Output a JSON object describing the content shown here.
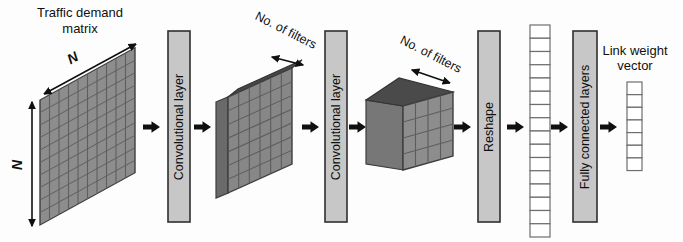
{
  "labels": {
    "traffic_matrix_lines": [
      "Traffic demand",
      "matrix"
    ],
    "matrix_dim_top": "N",
    "matrix_dim_left": "N",
    "conv1_filters": "No. of filters",
    "conv2_filters": "No. of filters",
    "output_lines": [
      "Link weight",
      "vector"
    ]
  },
  "layers": {
    "conv1": "Convolutional layer",
    "conv2": "Convolutional layer",
    "reshape": "Reshape",
    "fully_connected": "Fully connected layers"
  },
  "shapes": {
    "traffic_matrix": {
      "cols": 10,
      "rows": 10
    },
    "conv1_output": {
      "cols": 6,
      "rows": 7
    },
    "conv2_output": {
      "cols": 4,
      "rows": 4
    },
    "reshaped_vector": {
      "cells": 16
    },
    "link_weight_vector": {
      "cells": 7
    }
  },
  "colors": {
    "matrix_face": "#8d8d8d",
    "grid_line": "#5f5f5f",
    "box_top": "#474747",
    "box_side": "#6a6a6a",
    "layer_bar_fill": "#c7c7c7",
    "layer_bar_border": "#2f2f2f",
    "vector_cell": "#ffffff",
    "arrow": "#101010",
    "text": "#101010"
  }
}
